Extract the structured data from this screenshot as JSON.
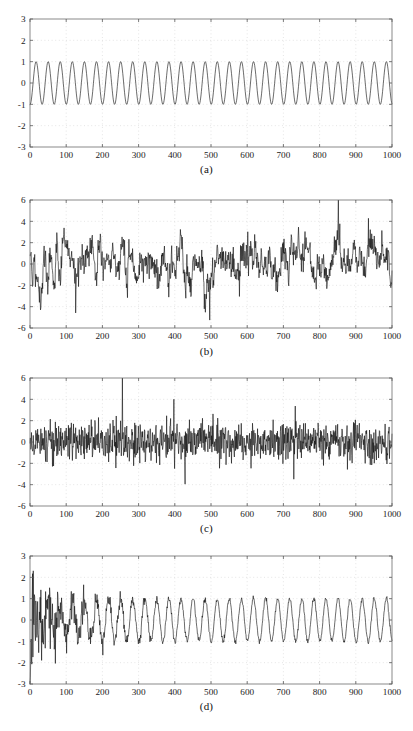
{
  "figure": {
    "background": "#ffffff",
    "line_color": "#111111",
    "axis_color": "#6d6d6d",
    "grid_color": "#cfcfcf",
    "panel_count": 4
  },
  "chart_data": [
    {
      "type": "line",
      "panel": "a",
      "caption": "(a)",
      "title": "",
      "xlabel": "",
      "ylabel": "",
      "xlim": [
        0,
        1000
      ],
      "ylim": [
        -3,
        3
      ],
      "xticks": [
        0,
        100,
        200,
        300,
        400,
        500,
        600,
        700,
        800,
        900,
        1000
      ],
      "yticks": [
        -3,
        -2,
        -1,
        0,
        1,
        2,
        3
      ],
      "xticklabels": [
        "0",
        "100",
        "200",
        "300",
        "400",
        "500",
        "600",
        "700",
        "800",
        "900",
        "1000"
      ],
      "yticklabels": [
        "-3",
        "-2",
        "-1",
        "0",
        "1",
        "2",
        "3"
      ],
      "grid": true,
      "legend": null,
      "description": "clean sinusoid, amplitude 1, about 30 cycles over 1000 samples",
      "generator": {
        "kind": "sine",
        "amplitude": 1.0,
        "cycles": 30,
        "phase": -1.6,
        "n": 1000
      },
      "box": {
        "x": 30,
        "y": 19,
        "w": 362,
        "h": 128
      },
      "caption_y": 163
    },
    {
      "type": "line",
      "panel": "b",
      "caption": "(b)",
      "title": "",
      "xlabel": "",
      "ylabel": "",
      "xlim": [
        0,
        1000
      ],
      "ylim": [
        -6,
        6
      ],
      "xticks": [
        0,
        100,
        200,
        300,
        400,
        500,
        600,
        700,
        800,
        900,
        1000
      ],
      "yticks": [
        -6,
        -4,
        -2,
        0,
        2,
        4,
        6
      ],
      "xticklabels": [
        "0",
        "100",
        "200",
        "300",
        "400",
        "500",
        "600",
        "700",
        "800",
        "900",
        "1000"
      ],
      "yticklabels": [
        "-6",
        "-4",
        "-2",
        "0",
        "2",
        "4",
        "6"
      ],
      "grid": true,
      "legend": null,
      "description": "correlated (coloured) noise, roughly zero mean, peaks near +5.5 and -6",
      "generator": {
        "kind": "colored-noise",
        "seed": 1734,
        "sigma": 1.45,
        "smooth": 3,
        "spike_gain": 1.25,
        "n": 1000
      },
      "box": {
        "x": 30,
        "y": 200,
        "w": 362,
        "h": 128
      },
      "caption_y": 345
    },
    {
      "type": "line",
      "panel": "c",
      "caption": "(c)",
      "title": "",
      "xlabel": "",
      "ylabel": "",
      "xlim": [
        0,
        1000
      ],
      "ylim": [
        -6,
        6
      ],
      "xticks": [
        0,
        100,
        200,
        300,
        400,
        500,
        600,
        700,
        800,
        900,
        1000
      ],
      "yticks": [
        -6,
        -4,
        -2,
        0,
        2,
        4,
        6
      ],
      "xticklabels": [
        "0",
        "100",
        "200",
        "300",
        "400",
        "500",
        "600",
        "700",
        "800",
        "900",
        "1000"
      ],
      "yticklabels": [
        "-6",
        "-4",
        "-2",
        "0",
        "2",
        "4",
        "6"
      ],
      "grid": true,
      "legend": null,
      "description": "dense white noise, standard deviation about 1, occasional spikes to +/-3.8",
      "generator": {
        "kind": "white-noise",
        "seed": 9021,
        "sigma": 0.95,
        "smooth": 0,
        "spike_gain": 1.0,
        "n": 1000
      },
      "box": {
        "x": 30,
        "y": 378,
        "w": 362,
        "h": 128
      },
      "caption_y": 522
    },
    {
      "type": "line",
      "panel": "d",
      "caption": "(d)",
      "title": "",
      "xlabel": "",
      "ylabel": "",
      "xlim": [
        0,
        1000
      ],
      "ylim": [
        -3,
        3
      ],
      "xticks": [
        0,
        100,
        200,
        300,
        400,
        500,
        600,
        700,
        800,
        900,
        1000
      ],
      "yticks": [
        -3,
        -2,
        -1,
        0,
        1,
        2,
        3
      ],
      "xticklabels": [
        "0",
        "100",
        "200",
        "300",
        "400",
        "500",
        "600",
        "700",
        "800",
        "900",
        "1000"
      ],
      "yticklabels": [
        "-3",
        "-2",
        "-1",
        "0",
        "1",
        "2",
        "3"
      ],
      "grid": true,
      "legend": null,
      "description": "recovered sinusoid: noisy transient for the first ~150 samples, then a clean amplitude-1 sine",
      "generator": {
        "kind": "converging-sine",
        "amplitude": 1.0,
        "cycles": 30,
        "phase": -1.6,
        "seed": 4421,
        "noise0": 1.1,
        "tau": 110,
        "transient": -3.0,
        "n": 1000
      },
      "box": {
        "x": 30,
        "y": 556,
        "w": 362,
        "h": 128
      },
      "caption_y": 700
    }
  ]
}
